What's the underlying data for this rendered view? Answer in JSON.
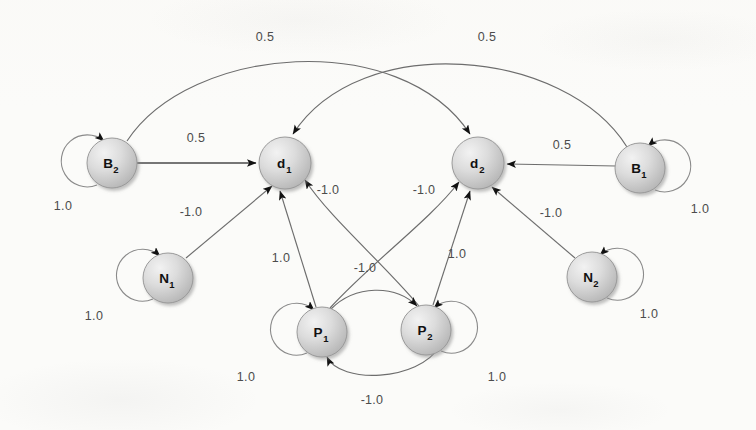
{
  "diagram": {
    "node_fill_light": "#e2e2e2",
    "node_fill_dark": "#bdbdbd",
    "edge_color": "#6d6d6d",
    "label_color": "#4c4c4c",
    "background": "#fbfbf9"
  },
  "nodes": [
    {
      "id": "B2",
      "base": "B",
      "sub": "2",
      "x": 112,
      "y": 163,
      "r": 25
    },
    {
      "id": "d1",
      "base": "d",
      "sub": "1",
      "x": 285,
      "y": 163,
      "r": 26
    },
    {
      "id": "d2",
      "base": "d",
      "sub": "2",
      "x": 478,
      "y": 163,
      "r": 26
    },
    {
      "id": "B1",
      "base": "B",
      "sub": "1",
      "x": 640,
      "y": 168,
      "r": 25
    },
    {
      "id": "N1",
      "base": "N",
      "sub": "1",
      "x": 168,
      "y": 278,
      "r": 25
    },
    {
      "id": "N2",
      "base": "N",
      "sub": "2",
      "x": 592,
      "y": 277,
      "r": 25
    },
    {
      "id": "P1",
      "base": "P",
      "sub": "1",
      "x": 322,
      "y": 332,
      "r": 25
    },
    {
      "id": "P2",
      "base": "P",
      "sub": "2",
      "x": 426,
      "y": 330,
      "r": 25
    }
  ],
  "edges": [
    {
      "id": "B2-d1",
      "from": "B2",
      "to": "d1",
      "weight": "0.5",
      "label_x": 196,
      "label_y": 142
    },
    {
      "id": "d2-B1",
      "from": "d2",
      "to": "B1",
      "weight": "0.5",
      "label_x": 562,
      "label_y": 149
    },
    {
      "id": "B2-d2",
      "from": "B2",
      "to": "d2",
      "weight": "0.5",
      "label_x": 265,
      "label_y": 41
    },
    {
      "id": "B1-d1",
      "from": "B1",
      "to": "d1",
      "weight": "0.5",
      "label_x": 487,
      "label_y": 41
    },
    {
      "id": "N1-d1",
      "from": "N1",
      "to": "d1",
      "weight": "-1.0",
      "label_x": 191,
      "label_y": 216
    },
    {
      "id": "N2-d2",
      "from": "N2",
      "to": "d2",
      "weight": "-1.0",
      "label_x": 551,
      "label_y": 217
    },
    {
      "id": "P1-d1",
      "from": "P1",
      "to": "d1",
      "weight": "1.0",
      "label_x": 281,
      "label_y": 262
    },
    {
      "id": "P2-d2",
      "from": "P2",
      "to": "d2",
      "weight": "1.0",
      "label_x": 457,
      "label_y": 258
    },
    {
      "id": "P1-d2",
      "from": "P1",
      "to": "d2",
      "weight": "-1.0",
      "label_x": 424,
      "label_y": 194
    },
    {
      "id": "P2-d1",
      "from": "P2",
      "to": "d1",
      "weight": "-1.0",
      "label_x": 328,
      "label_y": 194
    },
    {
      "id": "P1-P2",
      "from": "P1",
      "to": "P2",
      "weight": "-1.0",
      "label_x": 365,
      "label_y": 272
    },
    {
      "id": "P2-P1",
      "from": "P2",
      "to": "P1",
      "weight": "-1.0",
      "label_x": 372,
      "label_y": 404
    }
  ],
  "self_loops": [
    {
      "id": "loop-B2",
      "node": "B2",
      "weight": "1.0",
      "label_x": 63,
      "label_y": 210
    },
    {
      "id": "loop-B1",
      "node": "B1",
      "weight": "1.0",
      "label_x": 700,
      "label_y": 213
    },
    {
      "id": "loop-N1",
      "node": "N1",
      "weight": "1.0",
      "label_x": 94,
      "label_y": 320
    },
    {
      "id": "loop-N2",
      "node": "N2",
      "weight": "1.0",
      "label_x": 649,
      "label_y": 318
    },
    {
      "id": "loop-P1",
      "node": "P1",
      "weight": "1.0",
      "label_x": 246,
      "label_y": 381
    },
    {
      "id": "loop-P2",
      "node": "P2",
      "weight": "1.0",
      "label_x": 497,
      "label_y": 381
    }
  ]
}
